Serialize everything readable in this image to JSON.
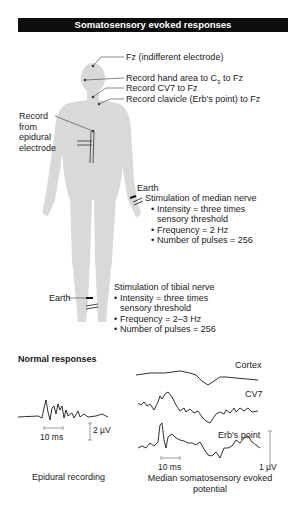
{
  "title": "Somatosensory evoked responses",
  "electrodes": {
    "fz": "Fz (indifferent electrode)",
    "hand_area_prefix": "Record hand area to C",
    "hand_area_sub": "3",
    "hand_area_suffix": " to Fz",
    "cv7": "Record CV7 to Fz",
    "clavicle": "Record clavicle (Erb's point) to Fz",
    "epidural": [
      "Record",
      "from",
      "epidural",
      "electrode"
    ]
  },
  "median": {
    "earth": "Earth",
    "heading": "Stimulation of median nerve",
    "bullets": [
      "Intensity = three times sensory threshold",
      "Frequency = 2 Hz",
      "Number of pulses = 256"
    ]
  },
  "tibial": {
    "earth": "Earth",
    "heading": "Stimulation of tibial nerve",
    "bullets": [
      "Intensity = three times sensory threshold",
      "Frequency = 2–3 Hz",
      "Number of pulses = 256"
    ]
  },
  "responses": {
    "heading": "Normal responses",
    "epidural": {
      "time_scale": "10 ms",
      "amp_scale": "2 µV",
      "caption": "Epidural recording"
    },
    "median": {
      "traces": [
        "Cortex",
        "CV7",
        "Erb's point"
      ],
      "time_scale": "10 ms",
      "amp_scale": "1 µV",
      "caption_line1": "Median somatosensory evoked",
      "caption_line2": "potential"
    }
  },
  "colors": {
    "title_bg": "#0d0d0d",
    "body_fill": "#d9d9d9",
    "trace": "#1a1a1a",
    "leader": "#555555"
  }
}
